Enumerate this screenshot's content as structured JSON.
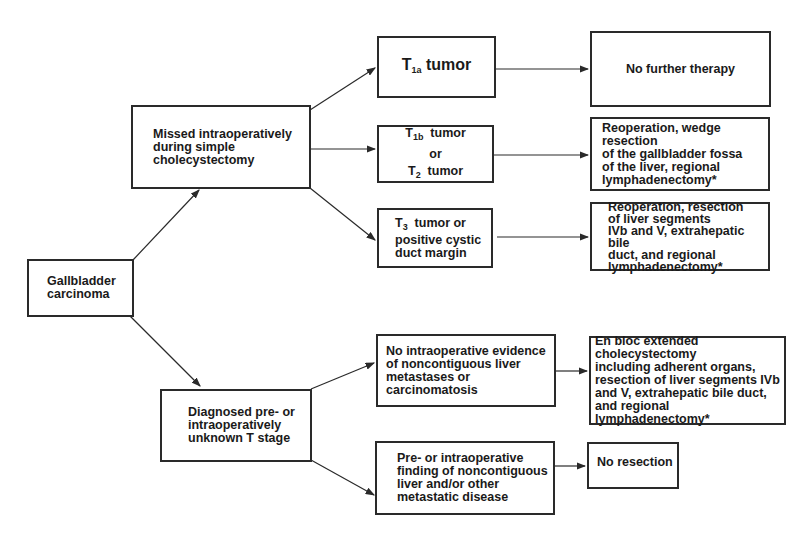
{
  "diagram": {
    "type": "flowchart",
    "nodes": {
      "root": {
        "label": "Gallbladder\ncarcinoma"
      },
      "missed": {
        "label": "Missed intraoperatively\nduring simple\ncholecystectomy"
      },
      "diagnosed": {
        "label": "Diagnosed pre- or\nintraoperatively\nunknown T stage"
      },
      "t1a": {
        "prefix": "T",
        "sub": "1a",
        "suffix": " tumor"
      },
      "t1b": {
        "prefix": "T",
        "sub": "1b",
        "suffix": "  tumor",
        "or": "or",
        "t2_prefix": "T",
        "t2_sub": "2",
        "t2_suffix": "  tumor"
      },
      "t3": {
        "prefix": "T",
        "sub": "3",
        "suffix": "  tumor or",
        "rest": "positive cystic\nduct margin"
      },
      "no_further": {
        "label": "No further therapy"
      },
      "wedge": {
        "label": "Reoperation, wedge resection\nof the gallbladder fossa\nof the liver, regional\nlymphadenectomy*"
      },
      "resection_seg": {
        "label": "Reoperation, resection\nof liver segments\nIVb and V, extrahepatic bile\nduct, and regional\nlymphadenectomy*"
      },
      "no_evidence": {
        "label": "No intraoperative evidence\nof noncontiguous liver\nmetastases or carcinomatosis"
      },
      "en_bloc": {
        "label": "En bloc extended cholecystectomy\nincluding adherent organs,\nresection of liver segments IVb\nand V, extrahepatic bile duct,\nand regional lymphadenectomy*"
      },
      "metastatic": {
        "label": "Pre- or intraoperative\nfinding of noncontiguous\nliver and/or other\nmetastatic disease"
      },
      "no_resection": {
        "label": "No resection"
      }
    },
    "edges": [
      [
        "root",
        "missed"
      ],
      [
        "root",
        "diagnosed"
      ],
      [
        "missed",
        "t1a"
      ],
      [
        "missed",
        "t1b"
      ],
      [
        "missed",
        "t3"
      ],
      [
        "t1a",
        "no_further"
      ],
      [
        "t1b",
        "wedge"
      ],
      [
        "t3",
        "resection_seg"
      ],
      [
        "diagnosed",
        "no_evidence"
      ],
      [
        "diagnosed",
        "metastatic"
      ],
      [
        "no_evidence",
        "en_bloc"
      ],
      [
        "metastatic",
        "no_resection"
      ]
    ]
  }
}
